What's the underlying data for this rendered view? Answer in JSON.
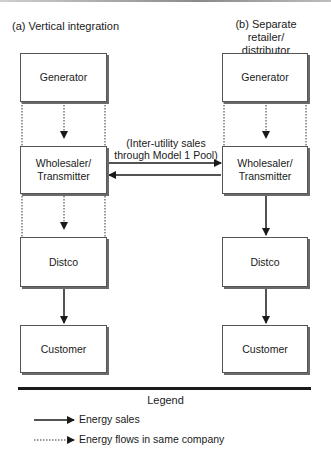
{
  "diagram": {
    "panels": [
      {
        "id": "a",
        "heading": "(a) Vertical integration",
        "boxes": [
          "Generator",
          "Wholesaler/ Transmitter",
          "Distco",
          "Customer"
        ],
        "links": [
          {
            "from": "Generator",
            "to": "Wholesaler/ Transmitter",
            "type": "energy-flow-same-company"
          },
          {
            "from": "Wholesaler/ Transmitter",
            "to": "Distco",
            "type": "energy-flow-same-company"
          },
          {
            "from": "Distco",
            "to": "Customer",
            "type": "energy-sales"
          }
        ]
      },
      {
        "id": "b",
        "heading_line1": "(b) Separate retailer/",
        "heading_line2": "distributor",
        "boxes": [
          "Generator",
          "Wholesaler/ Transmitter",
          "Distco",
          "Customer"
        ],
        "links": [
          {
            "from": "Generator",
            "to": "Wholesaler/ Transmitter",
            "type": "energy-flow-same-company"
          },
          {
            "from": "Wholesaler/ Transmitter",
            "to": "Distco",
            "type": "energy-sales"
          },
          {
            "from": "Distco",
            "to": "Customer",
            "type": "energy-sales"
          }
        ]
      }
    ],
    "inter_utility_note_line1": "(Inter-utility sales",
    "inter_utility_note_line2": "through Model 1 Pool)",
    "labels": {
      "a_heading": "(a) Vertical integration",
      "b_heading_line1": "(b) Separate retailer/",
      "b_heading_line2": "distributor",
      "generator": "Generator",
      "wholesaler_line1": "Wholesaler/",
      "wholesaler_line2": "Transmitter",
      "distco": "Distco",
      "customer": "Customer"
    },
    "legend": {
      "title": "Legend",
      "items": [
        {
          "style": "solid-arrow",
          "label": "Energy sales"
        },
        {
          "style": "dotted-arrow",
          "label": "Energy flows in same company"
        }
      ]
    },
    "colors": {
      "line": "#1a1a1a",
      "box_border": "#555555",
      "box_shadow": "#6a6a6a",
      "background": "#ffffff"
    }
  }
}
